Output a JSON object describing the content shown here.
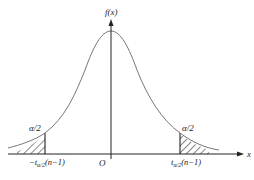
{
  "diagram": {
    "y_axis_label": "f(x)",
    "x_axis_label": "x",
    "origin_label": "O",
    "left_tail": {
      "area_label": "α/2",
      "critical_value": {
        "prefix": "−t",
        "subscript": "α/2",
        "suffix": "(n−1)"
      }
    },
    "right_tail": {
      "area_label": "α/2",
      "critical_value": {
        "prefix": "t",
        "subscript": "α/2",
        "suffix": "(n−1)"
      }
    },
    "colors": {
      "curve": "#777777",
      "axes": "#222222",
      "hatch": "#222222",
      "background": "#ffffff"
    }
  }
}
